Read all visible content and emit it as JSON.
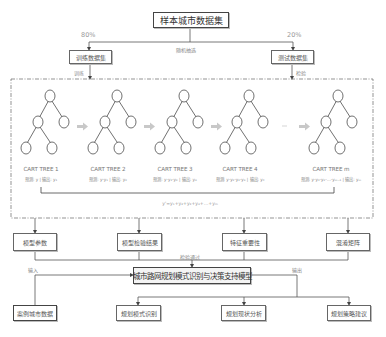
{
  "title_box": "样本城市数据集",
  "split": {
    "train_pct": "80%",
    "test_pct": "20%",
    "method": "随机抽选",
    "train_box": "训练数据集",
    "test_box": "测试数据集",
    "train_label": "训练",
    "test_label": "检验"
  },
  "forest": {
    "trees": [
      {
        "name": "CART TREE 1",
        "sub": "预测: y | 输出: y₁"
      },
      {
        "name": "CART TREE 2",
        "sub": "预测: y-y₁ | 输出: y₂"
      },
      {
        "name": "CART TREE 3",
        "sub": "预测: y-y₁-y₂ | 输出: y₃"
      },
      {
        "name": "CART TREE 4",
        "sub": "预测: y-y₁-y₂-y₃ | 输出: y₄"
      },
      {
        "name": "CART TREE m",
        "sub": "预测: y-y₁-y₂-…-yₘ₋₁ | 输出: yₘ"
      }
    ],
    "ellipsis": "…",
    "formula": "y'=y₁+y₂+y₃+y₄+…+yₘ"
  },
  "outputs": {
    "items": [
      "模型参数",
      "模型检验结果",
      "特征重要性",
      "混淆矩阵"
    ],
    "pass_label": "检验通过"
  },
  "model": {
    "main_box": "城市路网规划模式识别与决策支持模型",
    "input_label": "输入",
    "output_label": "输出",
    "input_box": "案例城市数据",
    "results": [
      "规划模式识别",
      "规划现状分析",
      "规划策略建议"
    ]
  }
}
